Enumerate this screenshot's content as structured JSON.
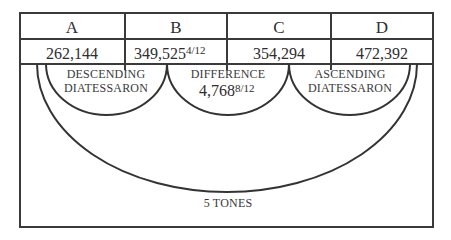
{
  "columns": [
    {
      "header": "A",
      "value": "262,144",
      "fraction": ""
    },
    {
      "header": "B",
      "value": "349,525",
      "fraction": "4/12"
    },
    {
      "header": "C",
      "value": "354,294",
      "fraction": ""
    },
    {
      "header": "D",
      "value": "472,392",
      "fraction": ""
    }
  ],
  "arcs": {
    "descending": {
      "line1": "DESCENDING",
      "line2": "DIATESSARON"
    },
    "difference": {
      "line1": "DIFFERENCE",
      "value": "4,768",
      "fraction": "8/12"
    },
    "ascending": {
      "line1": "ASCENDING",
      "line2": "DIATESSARON"
    },
    "outer": {
      "label": "5 TONES"
    }
  },
  "colors": {
    "stroke": "#333333",
    "text": "#2e2e2e",
    "background": "#ffffff"
  }
}
